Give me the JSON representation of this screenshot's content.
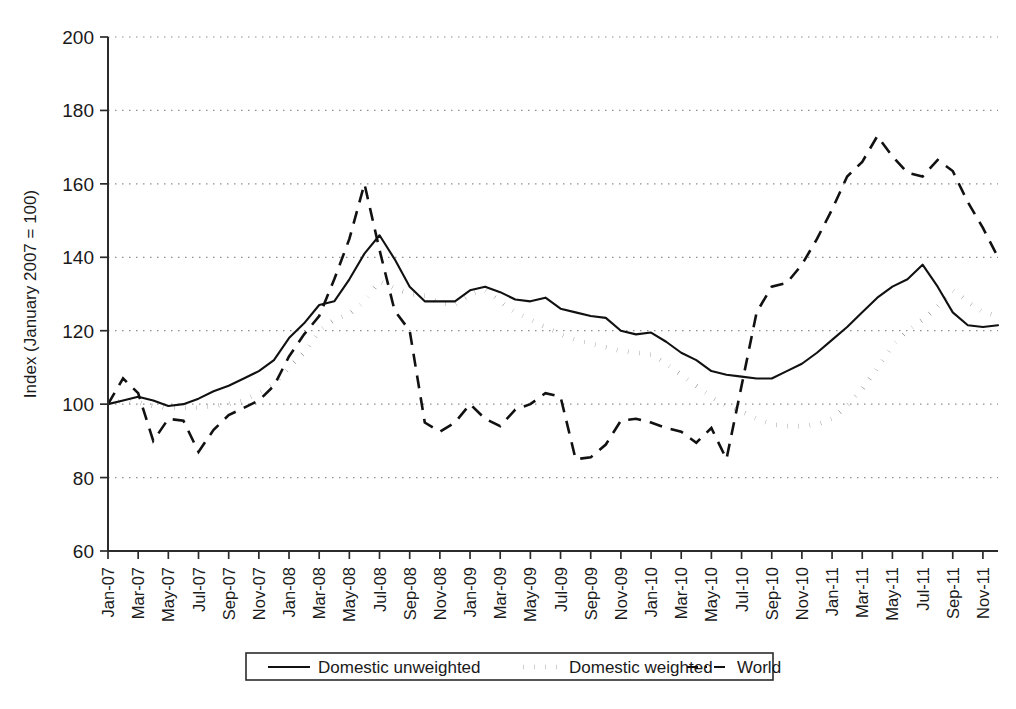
{
  "chart_data": {
    "type": "line",
    "title": "",
    "xlabel": "",
    "ylabel": "Index (January 2007 = 100)",
    "ylim": [
      60,
      200
    ],
    "yticks": [
      60,
      80,
      100,
      120,
      140,
      160,
      180,
      200
    ],
    "grid": true,
    "legend_position": "bottom",
    "x": [
      "Jan-07",
      "Feb-07",
      "Mar-07",
      "Apr-07",
      "May-07",
      "Jun-07",
      "Jul-07",
      "Aug-07",
      "Sep-07",
      "Oct-07",
      "Nov-07",
      "Dec-07",
      "Jan-08",
      "Feb-08",
      "Mar-08",
      "Apr-08",
      "May-08",
      "Jun-08",
      "Jul-08",
      "Aug-08",
      "Sep-08",
      "Oct-08",
      "Nov-08",
      "Dec-08",
      "Jan-09",
      "Feb-09",
      "Mar-09",
      "Apr-09",
      "May-09",
      "Jun-09",
      "Jul-09",
      "Aug-09",
      "Sep-09",
      "Oct-09",
      "Nov-09",
      "Dec-09",
      "Jan-10",
      "Feb-10",
      "Mar-10",
      "Apr-10",
      "May-10",
      "Jun-10",
      "Jul-10",
      "Aug-10",
      "Sep-10",
      "Oct-10",
      "Nov-10",
      "Dec-10",
      "Jan-11",
      "Feb-11",
      "Mar-11",
      "Apr-11",
      "May-11",
      "Jun-11",
      "Jul-11",
      "Aug-11",
      "Sep-11",
      "Oct-11",
      "Nov-11",
      "Dec-11"
    ],
    "xtick_labels": [
      "Jan-07",
      "Mar-07",
      "May-07",
      "Jul-07",
      "Sep-07",
      "Nov-07",
      "Jan-08",
      "Mar-08",
      "May-08",
      "Jul-08",
      "Sep-08",
      "Nov-08",
      "Jan-09",
      "Mar-09",
      "May-09",
      "Jul-09",
      "Sep-09",
      "Nov-09",
      "Jan-10",
      "Mar-10",
      "May-10",
      "Jul-10",
      "Sep-10",
      "Nov-10",
      "Jan-11",
      "Mar-11",
      "May-11",
      "Jul-11",
      "Sep-11",
      "Nov-11"
    ],
    "series": [
      {
        "name": "Domestic unweighted",
        "style": "solid",
        "values": [
          100,
          101,
          102,
          101,
          99.5,
          100,
          101.5,
          103.5,
          105,
          107,
          109,
          112,
          118,
          122,
          127,
          128,
          134,
          141,
          146,
          139.5,
          132,
          128,
          128,
          128,
          131,
          132,
          130.5,
          128.5,
          128,
          129,
          126,
          125,
          124,
          123.5,
          120,
          119,
          119.5,
          117,
          114,
          112,
          109,
          108,
          107.5,
          107,
          107,
          109,
          111,
          114,
          117.5,
          121,
          125,
          129,
          132,
          134,
          138,
          132,
          125,
          121.5,
          121,
          121.5
        ]
      },
      {
        "name": "Domestic weighted",
        "style": "dotted",
        "values": [
          100,
          101,
          100.5,
          99.5,
          99,
          99,
          99,
          99.5,
          100,
          101,
          103,
          105.5,
          110,
          114,
          120,
          123,
          124.5,
          128,
          133.5,
          131.5,
          130,
          129.5,
          127.5,
          127,
          130,
          131,
          128,
          125,
          123,
          121,
          119,
          117.5,
          116.5,
          115.5,
          114.5,
          114,
          113.5,
          111,
          108,
          105,
          102,
          99.5,
          98,
          96,
          94.5,
          94,
          94,
          94.5,
          96,
          99.5,
          104,
          110,
          116,
          120,
          123,
          126.5,
          131,
          128,
          125,
          124
        ]
      },
      {
        "name": "World",
        "style": "dashed",
        "values": [
          100,
          107,
          103,
          90,
          96,
          95.5,
          87,
          93,
          97,
          99,
          101,
          105,
          113,
          119,
          124,
          134,
          145,
          160,
          142,
          125.5,
          120,
          95,
          92.5,
          95,
          100,
          96,
          94,
          98.5,
          100,
          103,
          102,
          85,
          85.5,
          89,
          95.5,
          96,
          95,
          93.5,
          92.5,
          89.5,
          93.5,
          85,
          105,
          125,
          132,
          133,
          138,
          145,
          153,
          162,
          166,
          173,
          167.5,
          163,
          162,
          166.5,
          163.5,
          155,
          148,
          140
        ]
      }
    ]
  },
  "legend": {
    "items": [
      {
        "label": "Domestic unweighted"
      },
      {
        "label": "Domestic weighted"
      },
      {
        "label": "World"
      }
    ]
  },
  "axes": {
    "y_title": "Index (January 2007 = 100)"
  }
}
